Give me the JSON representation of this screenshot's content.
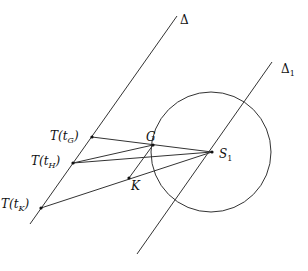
{
  "diagram": {
    "lines": {
      "delta": {
        "label": "Δ",
        "x1": 177,
        "y1": 16,
        "x2": 30,
        "y2": 224
      },
      "delta1": {
        "label": "Δ",
        "label_sub": "1",
        "x1": 272,
        "y1": 62,
        "x2": 137,
        "y2": 254
      }
    },
    "circle": {
      "cx": 211,
      "cy": 152,
      "r": 60
    },
    "points": {
      "T_tG": {
        "prefix": "T(t",
        "sub": "G",
        "suffix": ")",
        "x": 92,
        "y": 137
      },
      "T_tH": {
        "prefix": "T(t",
        "sub": "H",
        "suffix": ")",
        "x": 73,
        "y": 163
      },
      "T_tK": {
        "prefix": "T(t",
        "sub": "K",
        "suffix": ")",
        "x": 41,
        "y": 208
      },
      "G": {
        "label": "G",
        "x": 153,
        "y": 145
      },
      "K": {
        "label": "K",
        "x": 129,
        "y": 178
      },
      "S1": {
        "label": "S",
        "label_sub": "1",
        "x": 212,
        "y": 152
      }
    },
    "segments": [
      {
        "from": "T_tG",
        "to": "S1"
      },
      {
        "from": "T_tH",
        "to": "S1"
      },
      {
        "from": "T_tH",
        "to": "G"
      },
      {
        "from": "T_tK",
        "to": "S1"
      },
      {
        "from": "G",
        "to": "K"
      }
    ]
  }
}
